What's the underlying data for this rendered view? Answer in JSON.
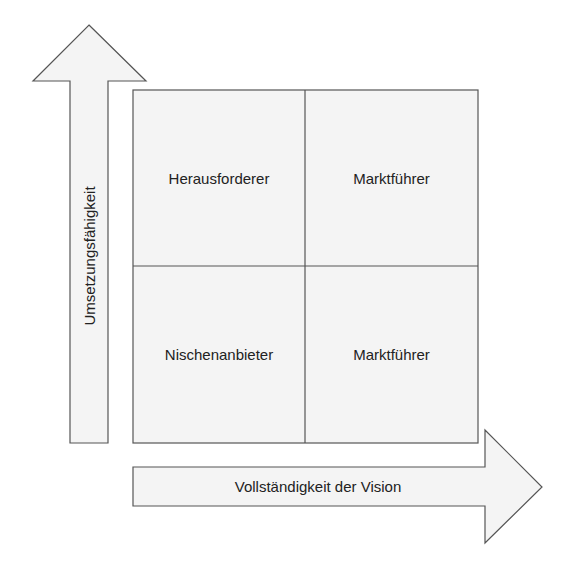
{
  "diagram": {
    "type": "quadrant-matrix",
    "colors": {
      "fill": "#f4f4f4",
      "stroke": "#555555",
      "text": "#222222",
      "background": "#ffffff"
    },
    "y_axis": {
      "label": "Umsetzungsfähigkeit",
      "direction": "up"
    },
    "x_axis": {
      "label": "Vollständigkeit der Vision",
      "direction": "right"
    },
    "quadrants": {
      "top_left": {
        "label": "Herausforderer"
      },
      "top_right": {
        "label": "Marktführer"
      },
      "bottom_left": {
        "label": "Nischenanbieter"
      },
      "bottom_right": {
        "label": "Marktführer"
      }
    }
  }
}
